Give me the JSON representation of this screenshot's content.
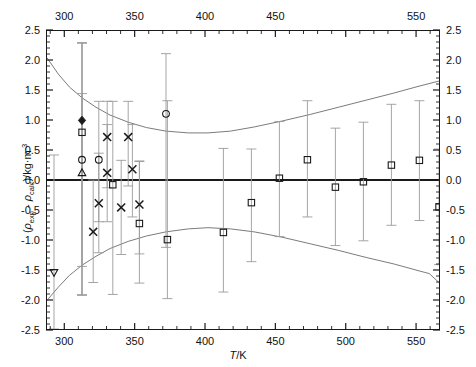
{
  "chart_data": {
    "type": "scatter",
    "title": "",
    "xlabel": "T/K",
    "ylabel": "(ρexp - ρcalc)/kg·m-3",
    "xlabel_parts": {
      "symbol": "T",
      "units": "/K"
    },
    "ylabel_parts": {
      "open": "(",
      "rho1": "ρ",
      "sub1": "exp",
      "minus": " - ",
      "rho2": "ρ",
      "sub2": "calc",
      "close": ")/kg·m",
      "sup": "-3"
    },
    "xlim": [
      287,
      567
    ],
    "ylim": [
      -2.5,
      2.5
    ],
    "grid": false,
    "legend": "none",
    "x_ticks_major": [
      300,
      350,
      400,
      450,
      500,
      550
    ],
    "x_ticks_minor_step": 10,
    "y_ticks_major": [
      -2.5,
      -2.0,
      -1.5,
      -1.0,
      -0.5,
      0.0,
      0.5,
      1.0,
      1.5,
      2.0,
      2.5
    ],
    "y_ticks_major_labels": [
      "-2.5",
      "-2.0",
      "-1.5",
      "-1.0",
      "-0.5",
      "0.0",
      "0.5",
      "1.0",
      "1.5",
      "2.0",
      "2.5"
    ],
    "y_ticks_minor_step": 0.1,
    "x_tick_labels_top": [
      "300",
      "350",
      "400",
      "450",
      "550"
    ],
    "x_tick_labels_bottom": [
      "300",
      "350",
      "400",
      "450",
      "500",
      "550"
    ],
    "zero_line": 0.0,
    "series": [
      {
        "name": "open-circle",
        "marker": "circle-open",
        "points": [
          {
            "x": 312,
            "y": 0.34,
            "elo": -1.93,
            "ehi": 2.3
          },
          {
            "x": 324,
            "y": 0.34,
            "elo": -0.7,
            "ehi": 1.32
          },
          {
            "x": 372,
            "y": 1.11,
            "elo": -1.13,
            "ehi": 2.12
          }
        ]
      },
      {
        "name": "filled-diamond",
        "marker": "diamond-filled",
        "points": [
          {
            "x": 312,
            "y": 1.0,
            "elo": -1.93,
            "ehi": 2.3
          }
        ]
      },
      {
        "name": "open-triangle-up",
        "marker": "triangle-up-open",
        "points": [
          {
            "x": 312,
            "y": 0.12,
            "elo": -1.45,
            "ehi": 1.45
          }
        ]
      },
      {
        "name": "open-triangle-down",
        "marker": "triangle-down-open",
        "points": [
          {
            "x": 292,
            "y": -1.55,
            "elo": -2.5,
            "ehi": 0.42
          }
        ]
      },
      {
        "name": "cross",
        "marker": "x",
        "points": [
          {
            "x": 320,
            "y": -0.87,
            "elo": -1.72,
            "ehi": 0.0
          },
          {
            "x": 330,
            "y": 0.72,
            "elo": -0.13,
            "ehi": 1.32
          },
          {
            "x": 330,
            "y": 0.12,
            "elo": -0.7,
            "ehi": 0.93
          },
          {
            "x": 324,
            "y": -0.39,
            "elo": -1.22,
            "ehi": 0.45
          },
          {
            "x": 340,
            "y": -0.46,
            "elo": -1.25,
            "ehi": 0.33
          },
          {
            "x": 345,
            "y": 0.72,
            "elo": -0.1,
            "ehi": 1.32
          },
          {
            "x": 348,
            "y": 0.18,
            "elo": -0.62,
            "ehi": 0.93
          },
          {
            "x": 353,
            "y": -0.41,
            "elo": -1.24,
            "ehi": 0.31
          }
        ]
      },
      {
        "name": "open-square",
        "marker": "square-open",
        "points": [
          {
            "x": 312,
            "y": 0.8,
            "elo": -1.93,
            "ehi": 2.3
          },
          {
            "x": 334,
            "y": -0.08,
            "elo": -1.92,
            "ehi": 1.32
          },
          {
            "x": 353,
            "y": -0.73,
            "elo": -1.73,
            "ehi": 0.32
          },
          {
            "x": 373,
            "y": -1.0,
            "elo": -1.99,
            "ehi": 1.33
          },
          {
            "x": 413,
            "y": -0.88,
            "elo": -1.88,
            "ehi": 0.53
          },
          {
            "x": 433,
            "y": -0.38,
            "elo": -1.37,
            "ehi": 0.52
          },
          {
            "x": 453,
            "y": 0.03,
            "elo": -0.95,
            "ehi": 0.98
          },
          {
            "x": 473,
            "y": 0.34,
            "elo": -0.62,
            "ehi": 1.33
          },
          {
            "x": 493,
            "y": -0.12,
            "elo": -1.1,
            "ehi": 0.87
          },
          {
            "x": 513,
            "y": -0.03,
            "elo": -1.02,
            "ehi": 0.97
          },
          {
            "x": 533,
            "y": 0.25,
            "elo": -0.76,
            "ehi": 1.27
          },
          {
            "x": 553,
            "y": 0.33,
            "elo": -0.68,
            "ehi": 1.33
          },
          {
            "x": 567,
            "y": -0.45,
            "elo": -1.42,
            "ehi": 0.52
          }
        ]
      }
    ],
    "envelope_upper": [
      {
        "x": 287,
        "y": 2.05
      },
      {
        "x": 295,
        "y": 1.78
      },
      {
        "x": 303,
        "y": 1.56
      },
      {
        "x": 312,
        "y": 1.38
      },
      {
        "x": 322,
        "y": 1.22
      },
      {
        "x": 332,
        "y": 1.09
      },
      {
        "x": 345,
        "y": 0.97
      },
      {
        "x": 358,
        "y": 0.88
      },
      {
        "x": 372,
        "y": 0.82
      },
      {
        "x": 388,
        "y": 0.79
      },
      {
        "x": 402,
        "y": 0.79
      },
      {
        "x": 418,
        "y": 0.82
      },
      {
        "x": 435,
        "y": 0.89
      },
      {
        "x": 455,
        "y": 0.99
      },
      {
        "x": 475,
        "y": 1.1
      },
      {
        "x": 495,
        "y": 1.22
      },
      {
        "x": 515,
        "y": 1.34
      },
      {
        "x": 535,
        "y": 1.46
      },
      {
        "x": 552,
        "y": 1.57
      },
      {
        "x": 567,
        "y": 1.66
      }
    ],
    "envelope_lower": [
      {
        "x": 287,
        "y": -2.02
      },
      {
        "x": 295,
        "y": -1.8
      },
      {
        "x": 303,
        "y": -1.6
      },
      {
        "x": 312,
        "y": -1.43
      },
      {
        "x": 322,
        "y": -1.28
      },
      {
        "x": 332,
        "y": -1.15
      },
      {
        "x": 345,
        "y": -1.03
      },
      {
        "x": 358,
        "y": -0.94
      },
      {
        "x": 372,
        "y": -0.87
      },
      {
        "x": 388,
        "y": -0.82
      },
      {
        "x": 402,
        "y": -0.8
      },
      {
        "x": 418,
        "y": -0.82
      },
      {
        "x": 435,
        "y": -0.87
      },
      {
        "x": 455,
        "y": -0.96
      },
      {
        "x": 475,
        "y": -1.07
      },
      {
        "x": 495,
        "y": -1.18
      },
      {
        "x": 515,
        "y": -1.3
      },
      {
        "x": 535,
        "y": -1.41
      },
      {
        "x": 552,
        "y": -1.52
      },
      {
        "x": 560,
        "y": -1.57
      },
      {
        "x": 567,
        "y": -1.72
      }
    ],
    "colors": {
      "axis": "#1a1a1a",
      "marker": "#1a1a1a",
      "errorbar": "#9a9a9a",
      "envelope": "#7a7a7a",
      "zero_line": "#1a1a1a",
      "background": "#ffffff"
    }
  }
}
